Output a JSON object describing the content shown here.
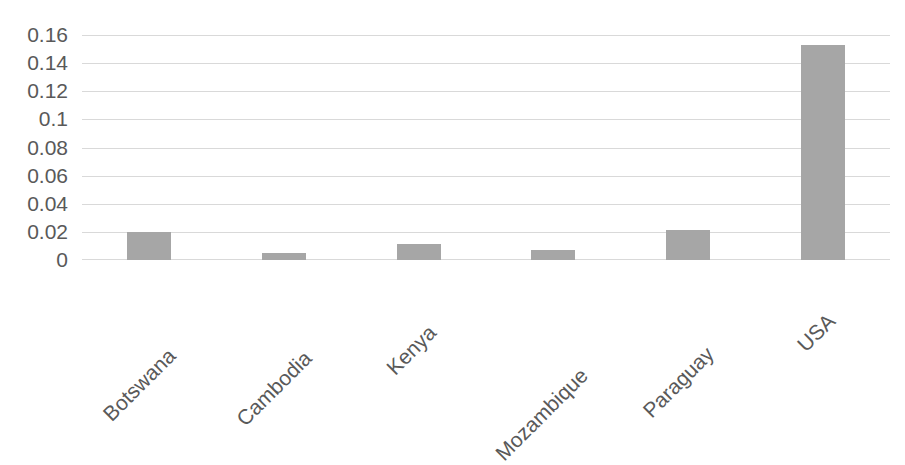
{
  "chart_data": {
    "type": "bar",
    "title": "",
    "subtitle": "",
    "xlabel": "",
    "ylabel": "",
    "categories": [
      "Botswana",
      "Cambodia",
      "Kenya",
      "Mozambique",
      "Paraguay",
      "USA"
    ],
    "values": [
      0.0198,
      0.005,
      0.0113,
      0.0068,
      0.0215,
      0.153
    ],
    "series": [
      {
        "name": "",
        "values": [
          0.0198,
          0.005,
          0.0113,
          0.0068,
          0.0215,
          0.153
        ]
      }
    ],
    "ylim": [
      0,
      0.16
    ],
    "ytick_labels": [
      "0.16",
      "0.14",
      "0.12",
      "0.1",
      "0.08",
      "0.06",
      "0.04",
      "0.02",
      "0"
    ],
    "ytick_values": [
      0.16,
      0.14,
      0.12,
      0.1,
      0.08,
      0.06,
      0.04,
      0.02,
      0
    ],
    "grid": true,
    "grid_axis": "y",
    "legend": false,
    "legend_position": "none",
    "annotations": [],
    "data_labels": false,
    "bar_color": "#a6a6a6",
    "grid_color": "#d9d9d9",
    "tick_label_color": "#595959",
    "background_color": "#ffffff",
    "x_label_rotation_deg": -45
  }
}
